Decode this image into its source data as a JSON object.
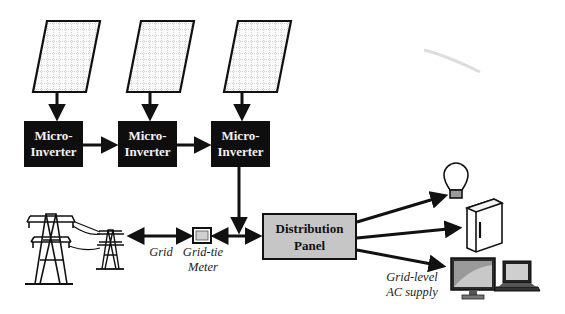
{
  "diagram": {
    "panels": [
      {
        "label": "solar-panel-1"
      },
      {
        "label": "solar-panel-2"
      },
      {
        "label": "solar-panel-3"
      }
    ],
    "inverters": [
      {
        "line1": "Micro-",
        "line2": "Inverter"
      },
      {
        "line1": "Micro-",
        "line2": "Inverter"
      },
      {
        "line1": "Micro-",
        "line2": "Inverter"
      }
    ],
    "distribution_panel": {
      "line1": "Distribution",
      "line2": "Panel"
    },
    "grid_label": "Grid",
    "meter_label": {
      "line1": "Grid-tie",
      "line2": "Meter"
    },
    "supply_label": {
      "line1": "Grid-level",
      "line2": "AC supply"
    },
    "loads": [
      "light-bulb",
      "refrigerator",
      "monitor",
      "laptop"
    ],
    "colors": {
      "inverter_fill": "#0e0e0e",
      "panel_fill": "#c6c6c6",
      "stroke": "#111111"
    }
  }
}
